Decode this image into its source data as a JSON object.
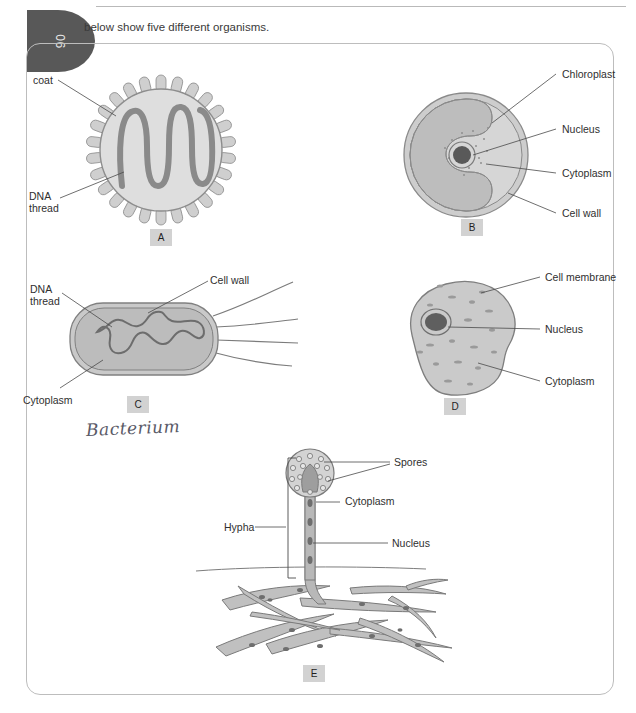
{
  "page": {
    "number": "90",
    "margin_word": "age",
    "intro_text": "below show five different organisms.",
    "handwriting": "Bacterium"
  },
  "figures": [
    {
      "tag": "A",
      "name": "virus",
      "labels": [
        {
          "text": "coat",
          "name": "label-coat"
        },
        {
          "text": "DNA",
          "name": "label-dna-line1"
        },
        {
          "text": "thread",
          "name": "label-dna-line2"
        }
      ]
    },
    {
      "tag": "B",
      "name": "plant-cell",
      "labels": [
        {
          "text": "Chloroplast",
          "name": "label-chloroplast"
        },
        {
          "text": "Nucleus",
          "name": "label-nucleus"
        },
        {
          "text": "Cytoplasm",
          "name": "label-cytoplasm"
        },
        {
          "text": "Cell wall",
          "name": "label-cell-wall"
        }
      ]
    },
    {
      "tag": "C",
      "name": "bacterium",
      "labels": [
        {
          "text": "DNA",
          "name": "label-dna-line1"
        },
        {
          "text": "thread",
          "name": "label-dna-line2"
        },
        {
          "text": "Cell wall",
          "name": "label-cell-wall"
        },
        {
          "text": "Cytoplasm",
          "name": "label-cytoplasm"
        }
      ]
    },
    {
      "tag": "D",
      "name": "animal-cell",
      "labels": [
        {
          "text": "Cell membrane",
          "name": "label-cell-membrane"
        },
        {
          "text": "Nucleus",
          "name": "label-nucleus"
        },
        {
          "text": "Cytoplasm",
          "name": "label-cytoplasm"
        }
      ]
    },
    {
      "tag": "E",
      "name": "fungus",
      "labels": [
        {
          "text": "Spores",
          "name": "label-spores"
        },
        {
          "text": "Cytoplasm",
          "name": "label-cytoplasm"
        },
        {
          "text": "Nucleus",
          "name": "label-nucleus"
        },
        {
          "text": "Hypha",
          "name": "label-hypha"
        }
      ]
    }
  ],
  "colors": {
    "tab_fill": "#585858",
    "tag_fill": "#d2d2d2",
    "cell_light": "#d9d9d9",
    "cell_mid": "#c2c2c2",
    "cell_dark": "#8f8f8f",
    "nucleus": "#5c5c5c",
    "outline": "#6e6e6e",
    "leader_line": "#4a4a4a",
    "ink": "#5a5a67"
  }
}
